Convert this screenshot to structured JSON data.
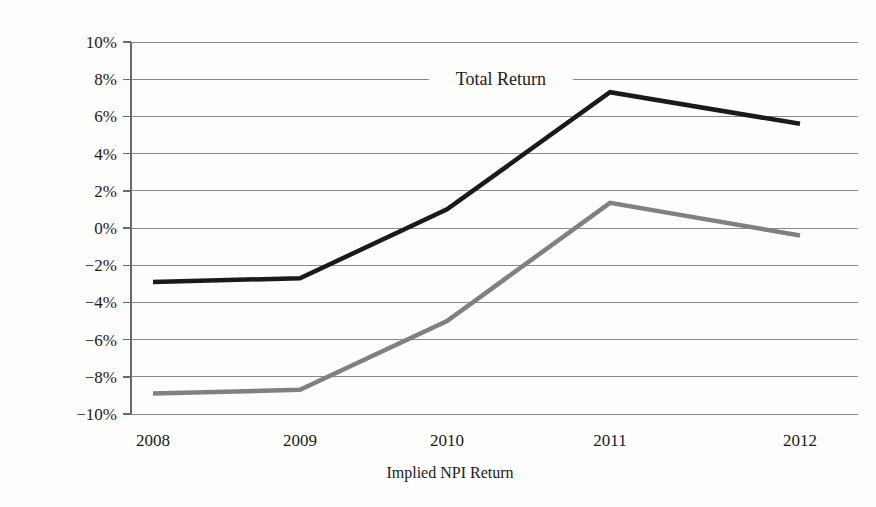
{
  "chart_data": {
    "type": "line",
    "title": "",
    "xlabel": "Implied NPI Return",
    "ylabel": "",
    "categories": [
      "2008",
      "2009",
      "2010",
      "2011",
      "2012"
    ],
    "x": [
      2008,
      2009,
      2010,
      2011,
      2012
    ],
    "ylim": [
      -10,
      10
    ],
    "ytick_values": [
      10,
      8,
      6,
      4,
      2,
      0,
      -2,
      -4,
      -6,
      -8,
      -10
    ],
    "ytick_labels": [
      "10%",
      "8%",
      "6%",
      "4%",
      "2%",
      "0%",
      "−2%",
      "−4%",
      "−6%",
      "−8%",
      "−10%"
    ],
    "grid": true,
    "legend_position": "inline-annotation",
    "annotations": [
      {
        "text": "Total Return",
        "x": 2010.33,
        "y": 8.0
      }
    ],
    "series": [
      {
        "name": "Total Return",
        "color": "#1a1a1a",
        "width": 4.5,
        "values": [
          -2.9,
          -2.7,
          1.0,
          7.3,
          5.6
        ]
      },
      {
        "name": "Implied NPI Return",
        "color": "#808080",
        "width": 4.5,
        "values": [
          -8.9,
          -8.7,
          -5.0,
          1.35,
          -0.4
        ]
      }
    ]
  },
  "colors": {
    "background": "#fdfdfc",
    "total_return_line": "#1a1a1a",
    "implied_npi_line": "#808080",
    "gridline": "#8a8a8a",
    "axis": "#6a6a6a",
    "text": "#1a1a1a"
  }
}
